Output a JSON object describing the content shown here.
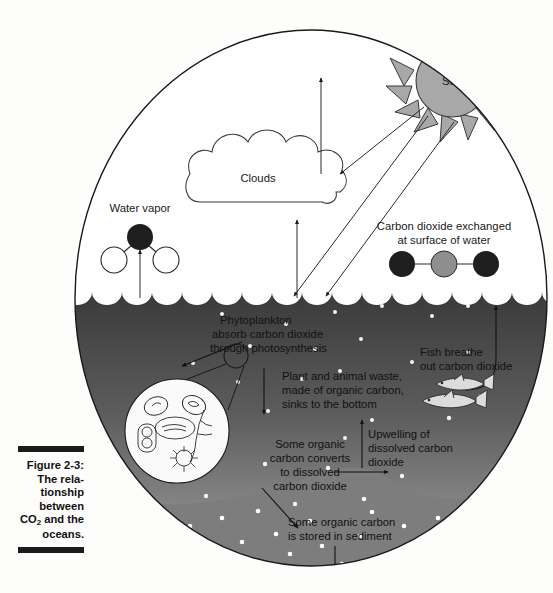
{
  "figure": {
    "caption_label": "Figure 2-3:",
    "caption_lines": [
      "The rela-",
      "tionship",
      "between",
      "and the",
      "oceans."
    ],
    "caption_co2_line_prefix": "CO",
    "caption_co2_subscript": "2",
    "caption_co2_line_suffix": " and the"
  },
  "diagram": {
    "sky": {
      "sun_label": "Sun",
      "clouds_label": "Clouds",
      "water_vapor_label": "Water vapor",
      "co2_surface_label_line1": "Carbon dioxide exchanged",
      "co2_surface_label_line2": "at surface of water"
    },
    "ocean": {
      "phytoplankton_line1": "Phytoplankton",
      "phytoplankton_line2": "absorb carbon dioxide",
      "phytoplankton_line3": "through photosynthesis",
      "waste_line1": "Plant and animal waste,",
      "waste_line2": "made of organic carbon,",
      "waste_line3": "sinks to the bottom",
      "fish_line1": "Fish breathe",
      "fish_line2": "out carbon dioxide",
      "upwelling_line1": "Upwelling of",
      "upwelling_line2": "dissolved carbon",
      "upwelling_line3": "dioxide",
      "converts_line1": "Some organic",
      "converts_line2": "carbon converts",
      "converts_line3": "to dissolved",
      "converts_line4": "carbon dioxide",
      "sediment_line1": "Some organic carbon",
      "sediment_line2": "is stored in sediment"
    },
    "colors": {
      "page_background": "#fdfdfc",
      "ink": "#1a1a1a",
      "sun_fill": "#a8a8a8",
      "ocean_top": "#3c3c3c",
      "ocean_bottom": "#9a9a9a",
      "sediment_fill": "#7d7d7d",
      "molecule_dark": "#1e1e1e",
      "molecule_mid": "#8e8e8e",
      "molecule_white": "#ffffff",
      "fish_fill": "#dcdcdc",
      "particle": "#f2f2f2"
    }
  }
}
